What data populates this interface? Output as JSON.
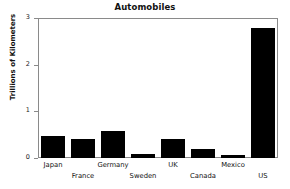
{
  "chart_data": {
    "type": "bar",
    "title": "Automobiles",
    "xlabel": "",
    "ylabel": "Trillions of Kilometers",
    "categories": [
      "Japan",
      "France",
      "Germany",
      "Sweden",
      "UK",
      "Canada",
      "Mexico",
      "US"
    ],
    "values": [
      0.48,
      0.4,
      0.58,
      0.08,
      0.4,
      0.2,
      0.06,
      2.78
    ],
    "ylim": [
      0,
      3
    ],
    "yticks": [
      0,
      1,
      2,
      3
    ],
    "ytick_labels": [
      "0",
      "1",
      "2",
      "3"
    ],
    "grid": false,
    "legend": false,
    "bar_color": "#000000",
    "frame_color": "#8a8a8a",
    "text_color": "#111111",
    "xtick_label_layout": "staggered-two-rows"
  }
}
